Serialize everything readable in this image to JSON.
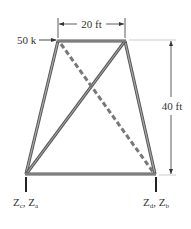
{
  "diagram": {
    "type": "truss",
    "load": {
      "label": "50 k",
      "direction": "right",
      "applied_at": "top-left joint"
    },
    "dimensions": {
      "top_width": {
        "label": "20 ft"
      },
      "height": {
        "label": "40 ft"
      }
    },
    "supports": {
      "left": {
        "label_main": "Z",
        "sub1": "c",
        "sep": ", ",
        "label_main2": "Z",
        "sub2": "a"
      },
      "right": {
        "label_main": "Z",
        "sub1": "d",
        "sep": ", ",
        "label_main2": "Z",
        "sub2": "b"
      }
    },
    "members": [
      {
        "name": "top-chord",
        "style": "solid"
      },
      {
        "name": "bottom-chord",
        "style": "solid"
      },
      {
        "name": "left-leg",
        "style": "solid"
      },
      {
        "name": "right-leg",
        "style": "solid"
      },
      {
        "name": "diagonal-top-right-to-bottom-left",
        "style": "solid"
      },
      {
        "name": "diagonal-top-left-to-bottom-right",
        "style": "dashed"
      }
    ],
    "colors": {
      "member": "#8a8a8a",
      "member_edge": "#555555",
      "dimension": "#333333",
      "text": "#333333"
    }
  }
}
